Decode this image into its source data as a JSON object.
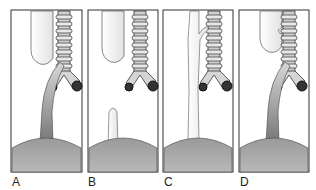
{
  "figure": {
    "panels": [
      {
        "label": "A",
        "variant": "upper-pouch-with-distal-fistula"
      },
      {
        "label": "B",
        "variant": "pure-atresia-no-fistula"
      },
      {
        "label": "C",
        "variant": "h-type-fistula"
      },
      {
        "label": "D",
        "variant": "upper-and-distal-fistula"
      }
    ]
  }
}
